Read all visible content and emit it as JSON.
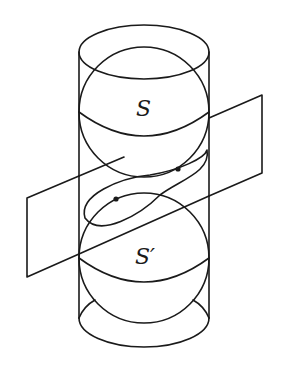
{
  "diagram": {
    "type": "Dandelin spheres in a cylinder cut by an inclined plane",
    "labels": {
      "upper_sphere": "S",
      "lower_sphere": "S′"
    },
    "colors": {
      "stroke": "#1a1a1a",
      "background": "#ffffff"
    },
    "elements": [
      "cylinder",
      "upper-sphere",
      "lower-sphere",
      "cutting-plane",
      "ellipse-intersection",
      "focus-point-upper",
      "focus-point-lower"
    ]
  }
}
